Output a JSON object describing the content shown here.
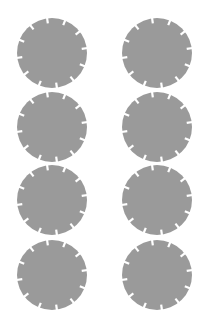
{
  "scene": {
    "background": "#ffffff",
    "shape_color": "#9a9a9a",
    "notch_color": "#ffffff",
    "shape": "notched-circle",
    "radius": 35,
    "notch_count": 12,
    "notch_length": 5,
    "notch_width": 2.2,
    "notch_offset_deg": -8,
    "columns": 2,
    "rows": 4
  },
  "items": [
    {
      "id": "circle-r1-c1",
      "cx": 52,
      "cy": 53
    },
    {
      "id": "circle-r1-c2",
      "cx": 157,
      "cy": 53
    },
    {
      "id": "circle-r2-c1",
      "cx": 52,
      "cy": 127
    },
    {
      "id": "circle-r2-c2",
      "cx": 157,
      "cy": 127
    },
    {
      "id": "circle-r3-c1",
      "cx": 52,
      "cy": 200
    },
    {
      "id": "circle-r3-c2",
      "cx": 157,
      "cy": 200
    },
    {
      "id": "circle-r4-c1",
      "cx": 52,
      "cy": 275
    },
    {
      "id": "circle-r4-c2",
      "cx": 157,
      "cy": 275
    }
  ]
}
